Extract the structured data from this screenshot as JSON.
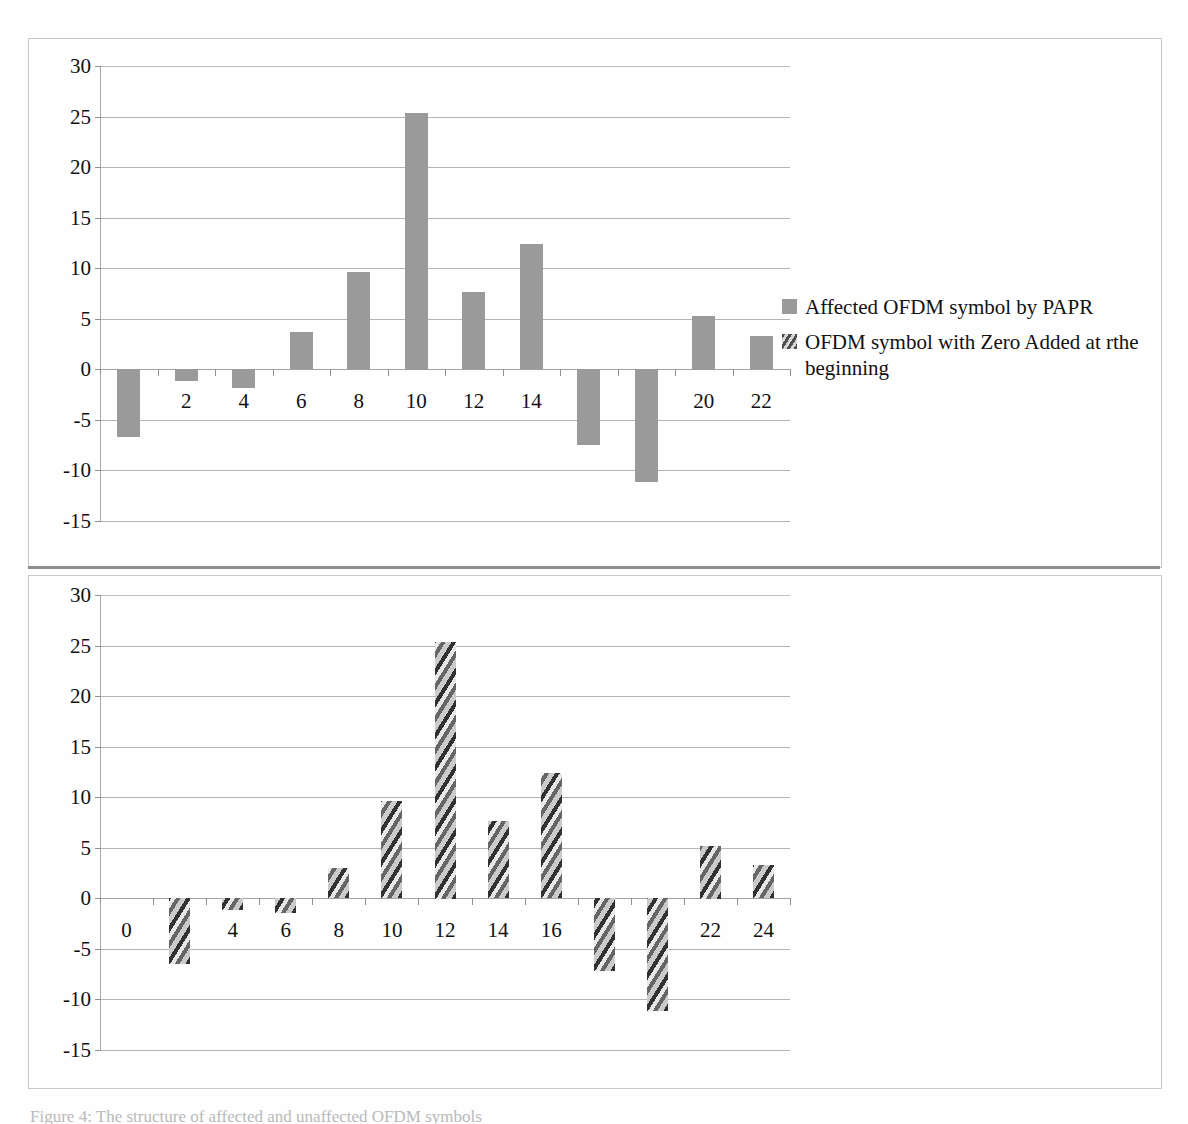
{
  "page": {
    "caption": "Figure 4: The structure of affected and unaffected OFDM symbols"
  },
  "legend": {
    "position": "right",
    "items": [
      {
        "label": "Affected OFDM symbol by PAPR",
        "style": "solid",
        "color": "#9a9a9a"
      },
      {
        "label": "OFDM symbol with Zero Added at rthe beginning",
        "style": "hatched",
        "color": "#a0a0a0"
      }
    ]
  },
  "chart_data": [
    {
      "id": "top",
      "type": "bar",
      "title": "",
      "xlabel": "",
      "ylabel": "",
      "ylim": [
        -15,
        30
      ],
      "yticks": [
        30,
        25,
        20,
        15,
        10,
        5,
        0,
        -5,
        -10,
        -15
      ],
      "ytick_labels": [
        "30",
        "25",
        "20",
        "15",
        "10",
        "5",
        "0",
        "-5",
        "-10",
        "-15"
      ],
      "grid": true,
      "legend_position": "right",
      "series_name": "Affected OFDM symbol by PAPR",
      "bar_style": "solid",
      "bar_color": "#9a9a9a",
      "categories": [
        0,
        2,
        4,
        6,
        8,
        10,
        12,
        14,
        16,
        18,
        20,
        22
      ],
      "xtick_labels": [
        "0",
        "2",
        "4",
        "6",
        "8",
        "10",
        "12",
        "14",
        "16",
        "18",
        "20",
        "22"
      ],
      "values": [
        -6.7,
        -1.2,
        -1.9,
        3.7,
        9.6,
        25.4,
        7.6,
        12.4,
        -7.5,
        -11.2,
        5.3,
        3.3
      ]
    },
    {
      "id": "bottom",
      "type": "bar",
      "title": "",
      "xlabel": "",
      "ylabel": "",
      "ylim": [
        -15,
        30
      ],
      "yticks": [
        30,
        25,
        20,
        15,
        10,
        5,
        0,
        -5,
        -10,
        -15
      ],
      "ytick_labels": [
        "30",
        "25",
        "20",
        "15",
        "10",
        "5",
        "0",
        "-5",
        "-10",
        "-15"
      ],
      "grid": true,
      "legend_position": "none",
      "series_name": "OFDM symbol with Zero Added at rthe beginning",
      "bar_style": "hatched",
      "bar_color": "#a0a0a0",
      "categories": [
        0,
        2,
        4,
        6,
        8,
        10,
        12,
        14,
        16,
        18,
        20,
        22,
        24
      ],
      "xtick_labels": [
        "0",
        "2",
        "4",
        "6",
        "8",
        "10",
        "12",
        "14",
        "16",
        "18",
        "20",
        "22",
        "24"
      ],
      "values": [
        0,
        -6.5,
        -1.2,
        -1.5,
        3.0,
        9.6,
        25.4,
        7.6,
        12.4,
        -7.2,
        -11.2,
        5.2,
        3.3
      ]
    }
  ]
}
